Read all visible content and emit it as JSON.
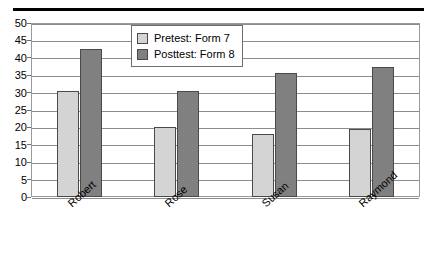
{
  "chart_data": {
    "type": "bar",
    "title": "",
    "subtitle": "",
    "xlabel": "",
    "ylabel": "",
    "categories": [
      "Robert",
      "Rose",
      "Susan",
      "Raymond"
    ],
    "series": [
      {
        "name": "Pretest: Form 7",
        "values": [
          30.5,
          20,
          18,
          19.5
        ],
        "color": "#d4d4d4"
      },
      {
        "name": "Posttest: Form 8",
        "values": [
          42.5,
          30.5,
          35.5,
          37.5
        ],
        "color": "#808080"
      }
    ],
    "ylim": [
      0,
      50
    ],
    "ytick_values": [
      0,
      5,
      10,
      15,
      20,
      25,
      30,
      35,
      40,
      45,
      50
    ],
    "ytick_labels": [
      "0",
      "5",
      "10",
      "15",
      "20",
      "25",
      "30",
      "35",
      "40",
      "45",
      "50"
    ],
    "grid": "horizontal",
    "legend_position": "top-center-left",
    "legend_entries": [
      "Pretest: Form 7",
      "Posttest: Form 8"
    ],
    "annotations": []
  },
  "figure": {
    "top_rule": "",
    "frame_color": "#9a9a9a",
    "gridline_color": "#8c8c8c",
    "background": "#ffffff"
  }
}
